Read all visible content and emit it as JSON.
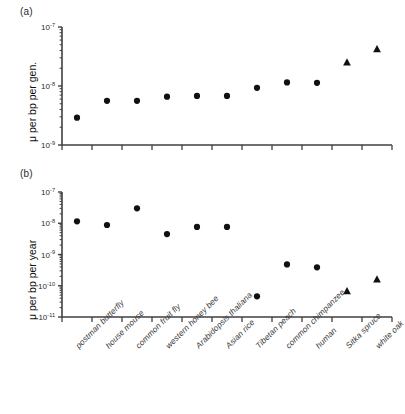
{
  "figure": {
    "panel_a_label": "(a)",
    "panel_b_label": "(b)"
  },
  "chart_data": [
    {
      "type": "scatter",
      "panel": "(a)",
      "title": "",
      "xlabel": "",
      "ylabel": "μ per bp per gen.",
      "yscale": "log",
      "ylim": [
        1e-09,
        1e-07
      ],
      "ytick_labels": [
        "10⁻⁷",
        "10⁻⁸",
        "10⁻⁹"
      ],
      "ytick_values": [
        1e-07,
        1e-08,
        1e-09
      ],
      "grid": false,
      "legend": "none",
      "categories": [
        "postman butterfly",
        "house mouse",
        "common fruit fly",
        "western honey bee",
        "Arabidopsis thaliana",
        "Asian rice",
        "Tibetan peach",
        "common chimpanzee",
        "human",
        "Sitka spruce",
        "white oak"
      ],
      "values": [
        2.9e-09,
        5.6e-09,
        5.6e-09,
        6.6e-09,
        6.8e-09,
        6.8e-09,
        9.3e-09,
        1.15e-08,
        1.13e-08,
        2.5e-08,
        4.2e-08
      ],
      "markers": [
        "circle",
        "circle",
        "circle",
        "circle",
        "circle",
        "circle",
        "circle",
        "circle",
        "circle",
        "triangle",
        "triangle"
      ]
    },
    {
      "type": "scatter",
      "panel": "(b)",
      "title": "",
      "xlabel": "",
      "ylabel": "μ per bp per year",
      "yscale": "log",
      "ylim": [
        1e-11,
        1e-07
      ],
      "ytick_labels": [
        "10⁻⁷",
        "10⁻⁸",
        "10⁻⁹",
        "10⁻¹⁰",
        "10⁻¹¹"
      ],
      "ytick_values": [
        1e-07,
        1e-08,
        1e-09,
        1e-10,
        1e-11
      ],
      "grid": false,
      "legend": "none",
      "categories": [
        "postman butterfly",
        "house mouse",
        "common fruit fly",
        "western honey bee",
        "Arabidopsis thaliana",
        "Asian rice",
        "Tibetan peach",
        "common chimpanzee",
        "human",
        "Sitka spruce",
        "white oak"
      ],
      "values": [
        1.15e-08,
        8.8e-09,
        3e-08,
        4.5e-09,
        7.6e-09,
        7.6e-09,
        4.6e-11,
        4.8e-10,
        3.9e-10,
        6.7e-11,
        1.6e-10
      ],
      "markers": [
        "circle",
        "circle",
        "circle",
        "circle",
        "circle",
        "circle",
        "circle",
        "circle",
        "circle",
        "triangle",
        "triangle"
      ]
    }
  ],
  "axis_labels": {
    "a_ytitle": "μ per bp per gen.",
    "b_ytitle": "μ per bp per year",
    "a_ticks": [
      "10",
      "−7",
      "10",
      "−8",
      "10",
      "−9"
    ],
    "b_ticks": [
      "10",
      "−7",
      "10",
      "−8",
      "10",
      "−9",
      "10",
      "−10",
      "10",
      "−11"
    ]
  },
  "categories": [
    "postman butterfly",
    "house mouse",
    "common fruit fly",
    "western honey bee",
    "Arabidopsis thaliana",
    "Asian rice",
    "Tibetan peach",
    "common chimpanzee",
    "human",
    "Sitka spruce",
    "white oak"
  ],
  "colors": {
    "marker": "#111111",
    "axis": "#3f3f3f",
    "text": "#2b2b2b"
  }
}
